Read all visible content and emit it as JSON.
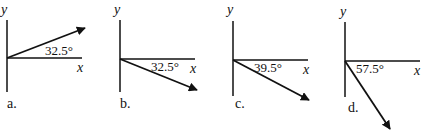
{
  "diagrams": [
    {
      "id": "a",
      "label": "a.",
      "angle": "32.5°",
      "axis_x": "x",
      "axis_y": "y",
      "direction": "above +x axis"
    },
    {
      "id": "b",
      "label": "b.",
      "angle": "32.5°",
      "axis_x": "x",
      "axis_y": "y",
      "direction": "below +x axis"
    },
    {
      "id": "c",
      "label": "c.",
      "angle": "39.5°",
      "axis_x": "x",
      "axis_y": "y",
      "direction": "below +x axis"
    },
    {
      "id": "d",
      "label": "d.",
      "angle": "57.5°",
      "axis_x": "x",
      "axis_y": "y",
      "direction": "below +x axis"
    }
  ],
  "colors": {
    "stroke": "#111111",
    "background": "#ffffff"
  }
}
